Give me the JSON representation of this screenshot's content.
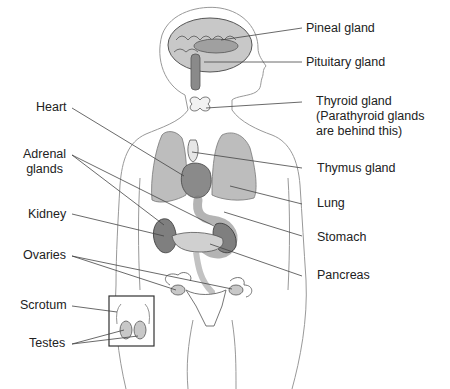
{
  "diagram": {
    "labels_right": [
      {
        "id": "pineal",
        "text": "Pineal gland"
      },
      {
        "id": "pituitary",
        "text": "Pituitary gland"
      },
      {
        "id": "thyroid",
        "line1": "Thyroid gland",
        "line2": "(Parathyroid glands",
        "line3": "are behind this)"
      },
      {
        "id": "thymus",
        "text": "Thymus gland"
      },
      {
        "id": "lung",
        "text": "Lung"
      },
      {
        "id": "stomach",
        "text": "Stomach"
      },
      {
        "id": "pancreas",
        "text": "Pancreas"
      }
    ],
    "labels_left": [
      {
        "id": "heart",
        "text": "Heart"
      },
      {
        "id": "adrenal",
        "line1": "Adrenal",
        "line2": "glands"
      },
      {
        "id": "kidney",
        "text": "Kidney"
      },
      {
        "id": "ovaries",
        "text": "Ovaries"
      },
      {
        "id": "scrotum",
        "text": "Scrotum"
      },
      {
        "id": "testes",
        "text": "Testes"
      }
    ],
    "colors": {
      "outline": "#888888",
      "organ_light": "#bdbdbd",
      "organ_dark": "#7a7a7a",
      "leader": "#444444",
      "text": "#222222"
    }
  }
}
